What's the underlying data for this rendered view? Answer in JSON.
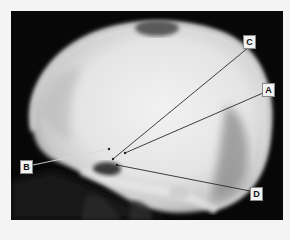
{
  "figure": {
    "colors": {
      "background": "#f4f4f4",
      "frame": "#070707",
      "bone": "#e6e6e6",
      "label_bg": "#f2f2f2",
      "leader_line": "#2a2a2a"
    },
    "labels": [
      {
        "id": "C",
        "text": "C",
        "box": [
          243,
          35
        ],
        "target": [
          113,
          159
        ],
        "anchor": [
          249,
          47
        ]
      },
      {
        "id": "A",
        "text": "A",
        "box": [
          262,
          83
        ],
        "target": [
          125,
          153
        ],
        "anchor": [
          263,
          93
        ]
      },
      {
        "id": "B",
        "text": "B",
        "box": [
          20,
          160
        ],
        "target": [
          109,
          149
        ],
        "anchor": [
          33,
          165
        ]
      },
      {
        "id": "D",
        "text": "D",
        "box": [
          250,
          187
        ],
        "target": [
          117,
          165
        ],
        "anchor": [
          250,
          191
        ]
      }
    ]
  }
}
